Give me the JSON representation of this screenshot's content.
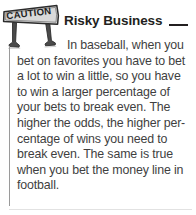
{
  "note": {
    "icon_label": "CAUTION",
    "title": "Risky Business",
    "body_lines": [
      "In baseball, when you",
      "bet on favorites you have to bet",
      "a lot to win a little, so you have",
      "to win a larger percentage of",
      "your bets to break even. The",
      "higher the odds, the higher per-",
      "centage of wins you need to",
      "break even. The same is true",
      "when you bet the money line in",
      "football."
    ],
    "body_text": "In baseball, when you bet on favorites you have to bet a lot to win a little, so you have to win a larger percentage of your bets to break even. The higher the odds, the higher percentage of wins you need to break even. The same is true when you bet the money line in football."
  },
  "colors": {
    "background": "#ffffff",
    "title": "#231f20",
    "body": "#3f3f3f",
    "title_rule": "#231f20",
    "left_rule": "#9a9a9a",
    "bottom_rule": "#e2e2e2",
    "icon_ink": "#3a3a3a"
  }
}
